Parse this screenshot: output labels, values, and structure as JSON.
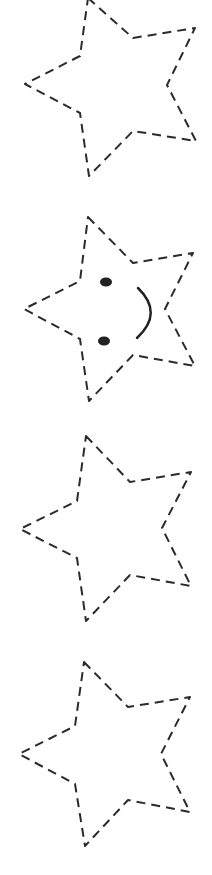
{
  "canvas": {
    "width": 212,
    "height": 875,
    "background": "#ffffff",
    "stroke_color": "#2b2b2b"
  },
  "stars": [
    {
      "id": "star-1",
      "points": "88,-2 133,38 195,28 167,85 196,141 133,131 89,176 80,113 25,84 80,56",
      "face": false
    },
    {
      "id": "star-2",
      "points": "88,217 133,263 193,253 165,309 195,366 133,355 89,401 80,339 24,309 80,281",
      "face": true,
      "eyes": [
        {
          "cx": 106,
          "cy": 282,
          "rx": 6,
          "ry": 4.5
        },
        {
          "cx": 104,
          "cy": 341,
          "rx": 6,
          "ry": 4.5
        }
      ],
      "mouth": "M138,288 Q164,313 137,338"
    },
    {
      "id": "star-3",
      "points": "86,436 130,482 191,472 162,528 191,586 130,575 86,621 77,558 20,529 77,501",
      "face": false
    },
    {
      "id": "star-4",
      "points": "84,662 128,707 190,697 161,754 190,812 128,800 85,846 75,784 19,754 75,726",
      "face": false
    }
  ]
}
